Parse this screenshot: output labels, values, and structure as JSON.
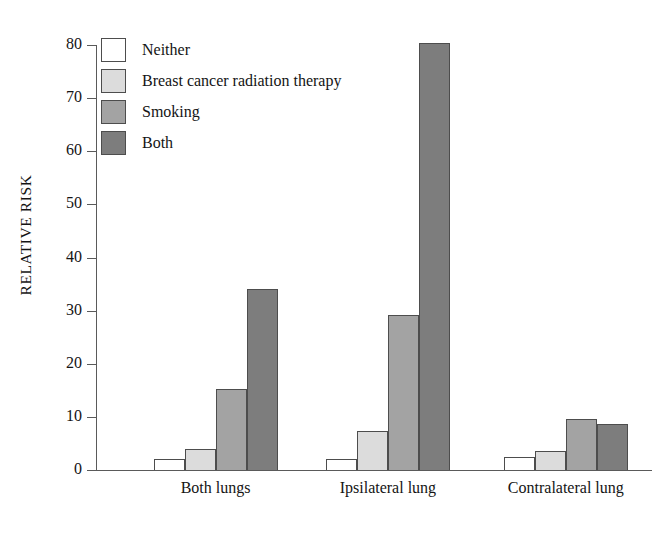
{
  "chart_data": {
    "type": "bar",
    "title": "",
    "xlabel": "",
    "ylabel": "RELATIVE RISK",
    "ylim": [
      0,
      80
    ],
    "yticks": [
      0,
      10,
      20,
      30,
      40,
      50,
      60,
      70,
      80
    ],
    "grid": false,
    "legend_position": "top-left",
    "categories": [
      "Both lungs",
      "Ipsilateral lung",
      "Contralateral lung"
    ],
    "series": [
      {
        "name": "Neither",
        "color": "#ffffff",
        "values": [
          2.0,
          2.1,
          2.4
        ]
      },
      {
        "name": "Breast cancer radiation therapy",
        "color": "#dcdcdc",
        "values": [
          4.0,
          7.3,
          3.5
        ]
      },
      {
        "name": "Smoking",
        "color": "#a3a3a3",
        "values": [
          15.2,
          29.2,
          9.6
        ]
      },
      {
        "name": "Both",
        "color": "#7d7d7d",
        "values": [
          34.0,
          80.3,
          8.7
        ]
      }
    ]
  },
  "axis": {
    "tick_labels": [
      "80",
      "70",
      "60",
      "50",
      "40",
      "30",
      "20",
      "10",
      "0"
    ],
    "y_title": "RELATIVE RISK"
  },
  "legend": {
    "items": [
      {
        "label": "Neither"
      },
      {
        "label": "Breast cancer radiation therapy"
      },
      {
        "label": "Smoking"
      },
      {
        "label": "Both"
      }
    ]
  }
}
